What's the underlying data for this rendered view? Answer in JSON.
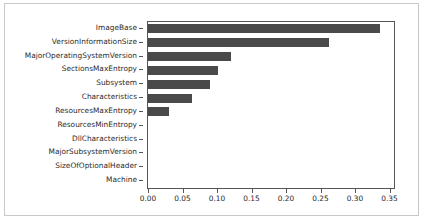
{
  "chart_data": {
    "type": "bar",
    "orientation": "horizontal",
    "title": "",
    "xlabel": "",
    "ylabel": "",
    "categories": [
      "ImageBase",
      "VersionInformationSize",
      "MajorOperatingSystemVersion",
      "SectionsMaxEntropy",
      "Subsystem",
      "Characteristics",
      "ResourcesMaxEntropy",
      "ResourcesMinEntropy",
      "DllCharacteristics",
      "MajorSubsystemVersion",
      "SizeOfOptionalHeader",
      "Machine"
    ],
    "values": [
      0.336,
      0.262,
      0.12,
      0.102,
      0.09,
      0.064,
      0.031,
      0.0,
      0.0,
      0.0,
      0.0,
      0.0
    ],
    "xlim": [
      0.0,
      0.3565
    ],
    "xticks": [
      0.0,
      0.05,
      0.1,
      0.15,
      0.2,
      0.25,
      0.3,
      0.35
    ],
    "xticklabels": [
      "0.00",
      "0.05",
      "0.10",
      "0.15",
      "0.20",
      "0.25",
      "0.30",
      "0.35"
    ],
    "grid": false,
    "legend": null,
    "bar_color": "#4a4a4a",
    "axis_color": "#555555",
    "background_color": "#ffffff",
    "border_color": "#c8c8c8"
  }
}
